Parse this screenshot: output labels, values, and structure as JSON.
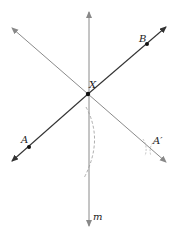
{
  "diagram": {
    "labels": {
      "A": "A",
      "B": "B",
      "X": "X",
      "A_prime": "A′",
      "m": "m"
    },
    "points": {
      "X": [
        88,
        94
      ],
      "A": [
        29,
        147
      ],
      "B": [
        147,
        44
      ],
      "A_prime": [
        149,
        147
      ]
    },
    "lines": {
      "line_AB": {
        "from": [
          11,
          162
        ],
        "to": [
          167,
          26
        ],
        "color": "#333333"
      },
      "line_XA_prime": {
        "from": [
          11,
          27
        ],
        "to": [
          167,
          163
        ],
        "color": "#8a8a8a"
      },
      "line_m": {
        "from": [
          89,
          11
        ],
        "to": [
          89,
          227
        ],
        "color": "#8a8a8a"
      }
    },
    "colors": {
      "dark_line": "#333333",
      "gray_line": "#8a8a8a",
      "point": "#111111"
    }
  }
}
